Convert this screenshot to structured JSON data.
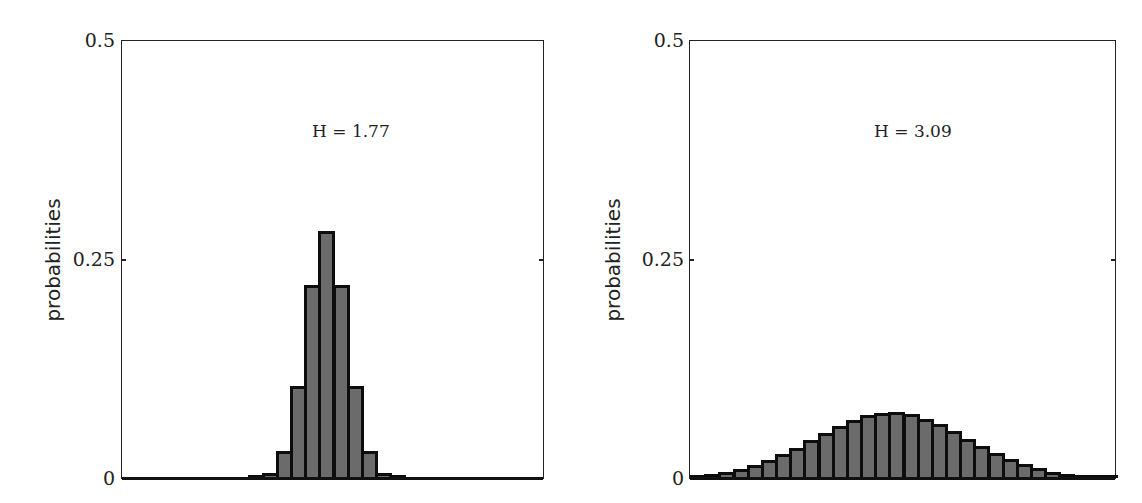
{
  "chart_data": [
    {
      "type": "bar",
      "title": "",
      "annotation": "H = 1.77",
      "xlabel": "",
      "ylabel": "probabilities",
      "ylim": [
        0,
        0.5
      ],
      "yticks": [
        0,
        0.25,
        0.5
      ],
      "ytick_labels": [
        "0",
        "0.25",
        "0.5"
      ],
      "grid": false,
      "categories": [
        0,
        1,
        2,
        3,
        4,
        5,
        6,
        7,
        8,
        9,
        10,
        11,
        12,
        13,
        14,
        15,
        16,
        17,
        18,
        19,
        20,
        21,
        22,
        23,
        24,
        25,
        26,
        27,
        28,
        29
      ],
      "values": [
        0,
        0,
        0,
        0,
        0,
        0,
        0,
        0,
        0.0002,
        0.001,
        0.006,
        0.031,
        0.105,
        0.221,
        0.283,
        0.221,
        0.105,
        0.031,
        0.006,
        0.001,
        0.0002,
        0,
        0,
        0,
        0,
        0,
        0,
        0,
        0,
        0
      ]
    },
    {
      "type": "bar",
      "title": "",
      "annotation": "H = 3.09",
      "xlabel": "",
      "ylabel": "probabilities",
      "ylim": [
        0,
        0.5
      ],
      "yticks": [
        0,
        0.25,
        0.5
      ],
      "ytick_labels": [
        "0",
        "0.25",
        "0.5"
      ],
      "grid": false,
      "categories": [
        0,
        1,
        2,
        3,
        4,
        5,
        6,
        7,
        8,
        9,
        10,
        11,
        12,
        13,
        14,
        15,
        16,
        17,
        18,
        19,
        20,
        21,
        22,
        23,
        24,
        25,
        26,
        27,
        28,
        29
      ],
      "values": [
        0.0028,
        0.0044,
        0.0068,
        0.0102,
        0.0146,
        0.0201,
        0.0269,
        0.0347,
        0.0431,
        0.0516,
        0.0598,
        0.0668,
        0.0719,
        0.0748,
        0.0751,
        0.0727,
        0.068,
        0.0613,
        0.0533,
        0.0448,
        0.0363,
        0.0284,
        0.0215,
        0.0156,
        0.011,
        0.0074,
        0.0049,
        0.0031,
        0.0019,
        0.0011
      ]
    }
  ],
  "panels": [
    {
      "ylabel": "probabilities",
      "annotation": "H = 1.77",
      "ticks": {
        "top": "0.5",
        "mid": "0.25",
        "bottom": "0"
      }
    },
    {
      "ylabel": "probabilities",
      "annotation": "H = 3.09",
      "ticks": {
        "top": "0.5",
        "mid": "0.25",
        "bottom": "0"
      }
    }
  ],
  "colors": {
    "bar_fill": "#6b6b6b",
    "bar_edge": "#0d0d0d",
    "axis": "#222222",
    "background": "#ffffff"
  }
}
